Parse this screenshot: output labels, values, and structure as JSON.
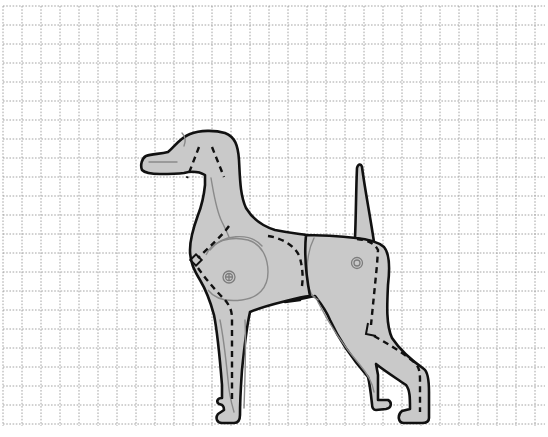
{
  "figure": {
    "title": "Dog paper model template",
    "grid": {
      "x0": 3,
      "y0": 6,
      "x1": 545,
      "y1": 426,
      "spacing": 19,
      "line_color": "#9a9a9a",
      "style": "dotted"
    },
    "colors": {
      "background": "#ffffff",
      "body_fill": "#c9c9c9",
      "outline": "#111111",
      "detail_lines": "#8a8a8a"
    },
    "parts": [
      {
        "name": "head-and-neck",
        "label": "Head and neck"
      },
      {
        "name": "front-shoulder-and-legs",
        "label": "Front shoulder and legs"
      },
      {
        "name": "hind-body-and-legs",
        "label": "Hind body and legs"
      },
      {
        "name": "tail",
        "label": "Tail"
      }
    ],
    "markers": {
      "cut_line": "dashed",
      "fold_marks": 2,
      "pivot_points": 2
    }
  }
}
